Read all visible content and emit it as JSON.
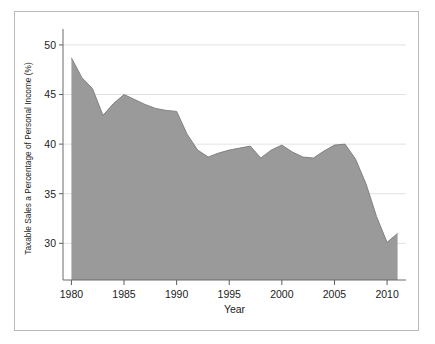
{
  "chart_data": {
    "type": "area",
    "title": "",
    "xlabel": "Year",
    "ylabel": "Taxable Sales a Percentage of Personal Income (%)",
    "x": [
      1980,
      1981,
      1982,
      1983,
      1984,
      1985,
      1986,
      1987,
      1988,
      1989,
      1990,
      1991,
      1992,
      1993,
      1994,
      1995,
      1996,
      1997,
      1998,
      1999,
      2000,
      2001,
      2002,
      2003,
      2004,
      2005,
      2006,
      2007,
      2008,
      2009,
      2010,
      2011
    ],
    "values": [
      48.7,
      46.7,
      45.6,
      42.9,
      44.1,
      45.0,
      44.5,
      44.0,
      43.6,
      43.4,
      43.3,
      41.0,
      39.4,
      38.7,
      39.1,
      39.4,
      39.6,
      39.8,
      38.6,
      39.4,
      39.9,
      39.2,
      38.7,
      38.6,
      39.3,
      39.9,
      40.0,
      38.5,
      36.0,
      32.7,
      30.1,
      31.0
    ],
    "xlim": [
      1979.2,
      2011.8
    ],
    "ylim": [
      26.3,
      50.8
    ],
    "xticks": [
      1980,
      1985,
      1990,
      1995,
      2000,
      2005,
      2010
    ],
    "xtick_labels": [
      "1980",
      "1985",
      "1990",
      "1995",
      "2000",
      "2005",
      "2010"
    ],
    "yticks": [
      30,
      35,
      40,
      45,
      50
    ],
    "ytick_labels": [
      "30",
      "35",
      "40",
      "45",
      "50"
    ],
    "grid": true,
    "legend": "none",
    "series_name": "Taxable Sales a Percentage of Personal Income",
    "colors": {
      "area_fill": "#9a9a9a",
      "area_stroke": "#7b7b7b",
      "gridline": "#e2e2e2",
      "axis": "#6a6a6a",
      "text": "#1c1c1c",
      "background": "#ffffff",
      "frame_border": "#b9b9b9"
    }
  }
}
